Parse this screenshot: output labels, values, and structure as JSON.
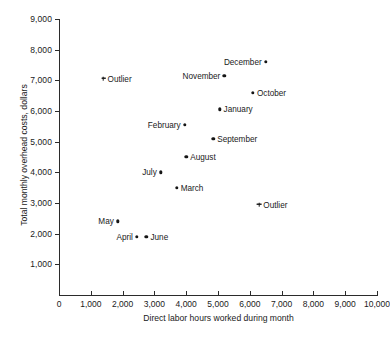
{
  "figure": {
    "top_cut_text": "",
    "xaxis": {
      "title": "Direct labor hours worked during month",
      "ticks": [
        "0",
        "1,000",
        "2,000",
        "3,000",
        "4,000",
        "5,000",
        "6,000",
        "7,000",
        "8,000",
        "9,000",
        "10,000"
      ]
    },
    "yaxis": {
      "title": "Total monthly overhead costs, dollars",
      "ticks": [
        "1,000",
        "2,000",
        "3,000",
        "4,000",
        "5,000",
        "6,000",
        "7,000",
        "8,000",
        "9,000"
      ]
    }
  },
  "chart_data": {
    "type": "scatter",
    "title": "",
    "xlabel": "Direct labor hours worked during month",
    "ylabel": "Total monthly overhead costs, dollars",
    "xlim": [
      0,
      10000
    ],
    "ylim": [
      0,
      9000
    ],
    "xticks": [
      0,
      1000,
      2000,
      3000,
      4000,
      5000,
      6000,
      7000,
      8000,
      9000,
      10000
    ],
    "yticks": [
      0,
      1000,
      2000,
      3000,
      4000,
      5000,
      6000,
      7000,
      8000,
      9000
    ],
    "grid": false,
    "legend": "none",
    "marker_color": "#161616",
    "points": [
      {
        "label": "Outlier",
        "x": 1400,
        "y": 7050,
        "marker": "star",
        "label_side": "right"
      },
      {
        "label": "December",
        "x": 6500,
        "y": 7600,
        "marker": "dot",
        "label_side": "left"
      },
      {
        "label": "November",
        "x": 5200,
        "y": 7150,
        "marker": "dot",
        "label_side": "left"
      },
      {
        "label": "October",
        "x": 6100,
        "y": 6600,
        "marker": "dot",
        "label_side": "right"
      },
      {
        "label": "January",
        "x": 5050,
        "y": 6050,
        "marker": "dot",
        "label_side": "right"
      },
      {
        "label": "February",
        "x": 3950,
        "y": 5550,
        "marker": "dot",
        "label_side": "left"
      },
      {
        "label": "September",
        "x": 4850,
        "y": 5100,
        "marker": "dot",
        "label_side": "right"
      },
      {
        "label": "August",
        "x": 4000,
        "y": 4500,
        "marker": "dot",
        "label_side": "right"
      },
      {
        "label": "July",
        "x": 3200,
        "y": 4000,
        "marker": "dot",
        "label_side": "left"
      },
      {
        "label": "March",
        "x": 3700,
        "y": 3500,
        "marker": "dot",
        "label_side": "right"
      },
      {
        "label": "Outlier",
        "x": 6300,
        "y": 2950,
        "marker": "star",
        "label_side": "right"
      },
      {
        "label": "May",
        "x": 1850,
        "y": 2400,
        "marker": "dot",
        "label_side": "left"
      },
      {
        "label": "April",
        "x": 2450,
        "y": 1900,
        "marker": "dot",
        "label_side": "left"
      },
      {
        "label": "June",
        "x": 2750,
        "y": 1900,
        "marker": "dot",
        "label_side": "right"
      }
    ]
  }
}
